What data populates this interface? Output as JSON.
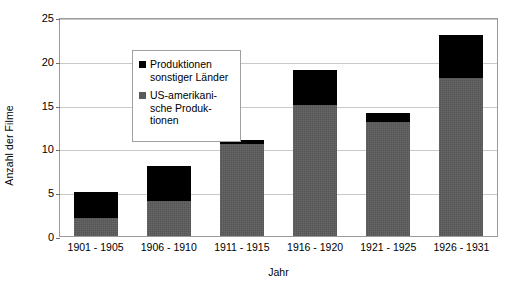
{
  "chart_data": {
    "type": "bar",
    "subtype": "stacked-vertical",
    "title": "",
    "xlabel": "Jahr",
    "ylabel": "Anzahl der Filme",
    "categories": [
      "1901 - 1905",
      "1906 - 1910",
      "1911 - 1915",
      "1916 - 1920",
      "1921 - 1925",
      "1926 - 1931"
    ],
    "series": [
      {
        "name": "US-amerikanische Produktionen",
        "color": "#555555",
        "values": [
          2,
          4,
          10.5,
          15,
          13,
          18
        ]
      },
      {
        "name": "Produktionen sonstiger Länder",
        "color": "#000000",
        "values": [
          3,
          4,
          0.5,
          4,
          1,
          5
        ]
      }
    ],
    "totals": [
      5,
      8,
      11,
      19,
      14,
      23
    ],
    "ylim": [
      0,
      25
    ],
    "yticks": [
      0,
      5,
      10,
      15,
      20,
      25
    ],
    "ytick_labels": [
      "0",
      "5",
      "10",
      "15",
      "20",
      "25"
    ],
    "grid": true,
    "grid_axis": "y",
    "legend_position": "upper-left-inside"
  },
  "legend": {
    "entries": [
      {
        "swatch": "black",
        "label": "Produktionen\nsonstiger Länder"
      },
      {
        "swatch": "gray",
        "label": "US-amerikani-\nsche Produk-\ntionen"
      }
    ]
  },
  "axes": {
    "y_title": "Anzahl der Filme",
    "x_title": "Jahr"
  }
}
